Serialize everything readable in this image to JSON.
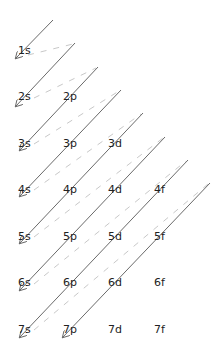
{
  "colors": {
    "arrow": "#6a6a6a",
    "connector": "#c8c8c8",
    "text": "#222222",
    "background": "#ffffff"
  },
  "rows": [
    {
      "n": 1,
      "orbitals": [
        "1s"
      ]
    },
    {
      "n": 2,
      "orbitals": [
        "2s",
        "2p"
      ]
    },
    {
      "n": 3,
      "orbitals": [
        "3s",
        "3p",
        "3d"
      ]
    },
    {
      "n": 4,
      "orbitals": [
        "4s",
        "4p",
        "4d",
        "4f"
      ]
    },
    {
      "n": 5,
      "orbitals": [
        "5s",
        "5p",
        "5d",
        "5f"
      ]
    },
    {
      "n": 6,
      "orbitals": [
        "6s",
        "6p",
        "6d",
        "6f"
      ]
    },
    {
      "n": 7,
      "orbitals": [
        "7s",
        "7p",
        "7d",
        "7f"
      ]
    }
  ],
  "labels": {
    "1s": "1s",
    "2s": "2s",
    "2p": "2p",
    "3s": "3s",
    "3p": "3p",
    "3d": "3d",
    "4s": "4s",
    "4p": "4p",
    "4d": "4d",
    "4f": "4f",
    "5s": "5s",
    "5p": "5p",
    "5d": "5d",
    "5f": "5f",
    "6s": "6s",
    "6p": "6p",
    "6d": "6d",
    "6f": "6f",
    "7s": "7s",
    "7p": "7p",
    "7d": "7d",
    "7f": "7f"
  },
  "filling_order": [
    "1s",
    "2s",
    "2p",
    "3s",
    "3p",
    "4s",
    "3d",
    "4p",
    "5s",
    "4d",
    "5p",
    "6s",
    "4f",
    "5d",
    "6p",
    "7s",
    "5f",
    "6d",
    "7p"
  ],
  "arrows": [
    {
      "from": [
        53,
        20
      ],
      "to": [
        16,
        58
      ],
      "ends_at": "1s"
    },
    {
      "from": [
        75,
        43
      ],
      "to": [
        16,
        106
      ],
      "ends_at": "2s"
    },
    {
      "from": [
        98,
        67
      ],
      "to": [
        20,
        150
      ],
      "ends_at": "3s"
    },
    {
      "from": [
        121,
        90
      ],
      "to": [
        20,
        196
      ],
      "ends_at": "4s"
    },
    {
      "from": [
        143,
        113
      ],
      "to": [
        20,
        243
      ],
      "ends_at": "5s"
    },
    {
      "from": [
        165,
        137
      ],
      "to": [
        20,
        290
      ],
      "ends_at": "6s"
    },
    {
      "from": [
        188,
        160
      ],
      "to": [
        20,
        337
      ],
      "ends_at": "7s"
    },
    {
      "from": [
        210,
        183
      ],
      "to": [
        63,
        337
      ],
      "ends_at": "7p"
    }
  ]
}
